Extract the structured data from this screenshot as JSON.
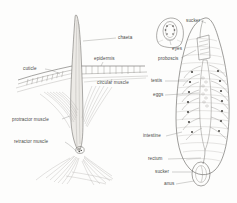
{
  "plate": {
    "title": "Annelid chaeta and leech internal anatomy",
    "background_color": "#fdfdfc",
    "ink_color": "#5c5a57",
    "label_color": "#4a4a48"
  },
  "figures": [
    {
      "id": "chaeta-figure",
      "name": "Chaeta and body wall section",
      "labels": [
        {
          "key": "chaeta",
          "text": "chaeta",
          "x": 118,
          "y": 39,
          "anchor": "start"
        },
        {
          "key": "epidermis",
          "text": "epidermis",
          "x": 94,
          "y": 60,
          "anchor": "start"
        },
        {
          "key": "cuticle",
          "text": "cuticle",
          "x": 23,
          "y": 70,
          "anchor": "start"
        },
        {
          "key": "circular-muscle",
          "text": "circular muscle",
          "x": 97,
          "y": 84,
          "anchor": "start"
        },
        {
          "key": "protractor-muscle",
          "text": "protractor muscle",
          "x": 12,
          "y": 121,
          "anchor": "start"
        },
        {
          "key": "retractor-muscle",
          "text": "retractor muscle",
          "x": 14,
          "y": 143,
          "anchor": "start"
        }
      ]
    },
    {
      "id": "leech-figure",
      "name": "Leech internal anatomy with anterior sucker inset",
      "labels": [
        {
          "key": "sucker-anterior",
          "text": "sucker",
          "x": 186,
          "y": 22,
          "anchor": "start"
        },
        {
          "key": "eyes",
          "text": "eyes",
          "x": 172,
          "y": 50,
          "anchor": "start"
        },
        {
          "key": "proboscis",
          "text": "proboscis",
          "x": 158,
          "y": 60,
          "anchor": "start"
        },
        {
          "key": "testis",
          "text": "testis",
          "x": 151,
          "y": 82,
          "anchor": "start"
        },
        {
          "key": "eggs",
          "text": "eggs",
          "x": 153,
          "y": 96,
          "anchor": "start"
        },
        {
          "key": "intestine",
          "text": "intestine",
          "x": 143,
          "y": 137,
          "anchor": "start"
        },
        {
          "key": "rectum",
          "text": "rectum",
          "x": 148,
          "y": 160,
          "anchor": "start"
        },
        {
          "key": "sucker-posterior",
          "text": "sucker",
          "x": 155,
          "y": 173,
          "anchor": "start"
        },
        {
          "key": "anus",
          "text": "anus",
          "x": 164,
          "y": 185,
          "anchor": "start"
        }
      ]
    }
  ]
}
